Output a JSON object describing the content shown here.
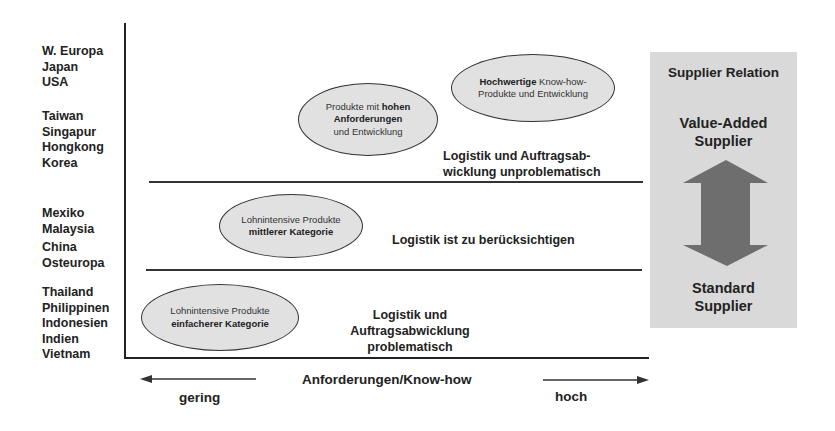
{
  "y_axis": {
    "country_groups": [
      {
        "countries": [
          "W. Europa",
          "Japan",
          "USA"
        ]
      },
      {
        "countries": [
          "Taiwan",
          "Singapur",
          "Hongkong",
          "Korea"
        ]
      },
      {
        "countries": [
          "Mexiko",
          "Malaysia"
        ]
      },
      {
        "countries": [
          "China",
          "Osteuropa"
        ]
      },
      {
        "countries": [
          "Thailand",
          "Philippinen",
          "Indonesien",
          "Indien",
          "Vietnam"
        ]
      }
    ]
  },
  "ellipses": [
    {
      "parts": [
        {
          "text": "Hochwertige",
          "bold": true
        },
        {
          "text": " Know-how-",
          "bold": false
        }
      ],
      "line2": "Produkte und Entwicklung"
    },
    {
      "line1_normal": "Produkte mit ",
      "line1_bold": "hohen",
      "line2_bold": "Anforderungen",
      "line3": "und Entwicklung"
    },
    {
      "line1": "Lohnintensive Produkte",
      "line2_bold": "mittlerer Kategorie"
    },
    {
      "line1": "Lohnintensive Produkte",
      "line2_bold": "einfacherer Kategorie"
    }
  ],
  "logistics": {
    "top": [
      "Logistik und Auftragsab-",
      "wicklung unproblematisch"
    ],
    "middle": "Logistik ist zu berücksichtigen",
    "bottom": [
      "Logistik und Auftragsabwicklung",
      "problematisch"
    ]
  },
  "x_axis": {
    "label": "Anforderungen/Know-how",
    "low": "gering",
    "high": "hoch"
  },
  "supplier_panel": {
    "title": "Supplier Relation",
    "top_label": [
      "Value-Added",
      "Supplier"
    ],
    "bottom_label": [
      "Standard",
      "Supplier"
    ]
  },
  "colors": {
    "panel_bg": "#d9d9d9",
    "arrow": "#6e6e6e",
    "ellipse_fill": "#e1e1e1",
    "text": "#222222"
  }
}
